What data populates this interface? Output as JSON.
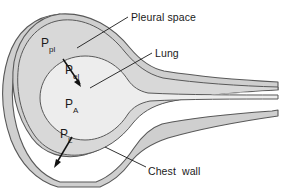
{
  "figure": {
    "background_color": "#ffffff",
    "outline_color": "#595959",
    "chest_wall_fill": "#cfcfcf",
    "pleural_space_fill": "#d8d8d8",
    "lung_fill": "#ededed",
    "airway_fill": "#ffffff",
    "label_color": "#1a1a1a",
    "leader_color": "#1a1a1a"
  },
  "callouts": {
    "pleural_space": "Pleural space",
    "lung": "Lung",
    "chest_wall": "Chest  wall"
  },
  "pressures": {
    "pleural": {
      "base": "P",
      "sub": "pl"
    },
    "elastic_recoil": {
      "base": "P",
      "sub": "el"
    },
    "alveolar": {
      "base": "P",
      "sub": "A"
    },
    "transpulmonary": {
      "base": "P",
      "sub": "L"
    }
  },
  "arrows": {
    "elastic_recoil": {
      "direction": "down-left-inward"
    },
    "transpulmonary": {
      "direction": "down-left-outward"
    }
  },
  "leader_lines": {
    "pleural_space": "from label down-left to pleural layer",
    "lung": "from label down-left to lung surface",
    "chest_wall": "from label up-left to chest wall"
  }
}
